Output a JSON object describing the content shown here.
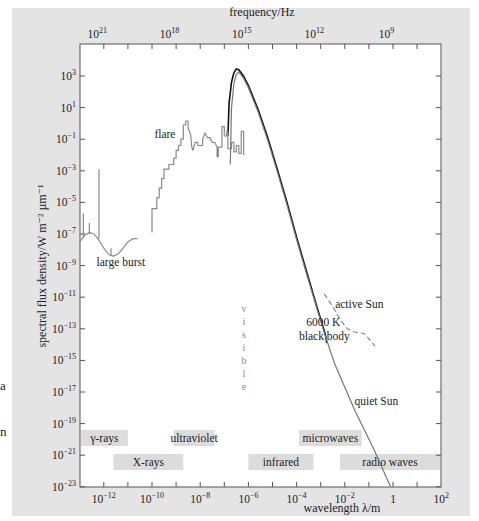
{
  "chart_data": {
    "type": "line",
    "title": "",
    "xlabel": "wavelength λ/m",
    "ylabel": "spectral flux density/W m⁻² µm⁻¹",
    "top_xlabel": "frequency/Hz",
    "x_scale": "log",
    "y_scale": "log",
    "xlim_log10": [
      -13,
      2
    ],
    "ylim_log10": [
      -23,
      4.9
    ],
    "x_ticks": [
      {
        "exp": "-12",
        "log": -12,
        "base": "10"
      },
      {
        "exp": "-10",
        "log": -10,
        "base": "10"
      },
      {
        "exp": "-8",
        "log": -8,
        "base": "10"
      },
      {
        "exp": "-6",
        "log": -6,
        "base": "10"
      },
      {
        "exp": "-4",
        "log": -4,
        "base": "10"
      },
      {
        "exp": "-2",
        "log": -2,
        "base": "10"
      },
      {
        "exp": "",
        "log": 0,
        "base": "1"
      },
      {
        "exp": "2",
        "log": 2,
        "base": "10"
      }
    ],
    "top_ticks": [
      {
        "exp": "21",
        "lambda_log": -12.52,
        "base": "10"
      },
      {
        "exp": "18",
        "lambda_log": -9.52,
        "base": "10"
      },
      {
        "exp": "15",
        "lambda_log": -6.52,
        "base": "10"
      },
      {
        "exp": "12",
        "lambda_log": -3.52,
        "base": "10"
      },
      {
        "exp": "9",
        "lambda_log": -0.52,
        "base": "10"
      }
    ],
    "y_ticks": [
      {
        "exp": "3",
        "log": 3
      },
      {
        "exp": "1",
        "log": 1
      },
      {
        "exp": "−1",
        "log": -1
      },
      {
        "exp": "−3",
        "log": -3
      },
      {
        "exp": "−5",
        "log": -5
      },
      {
        "exp": "−7",
        "log": -7
      },
      {
        "exp": "−9",
        "log": -9
      },
      {
        "exp": "−11",
        "log": -11
      },
      {
        "exp": "−13",
        "log": -13
      },
      {
        "exp": "−15",
        "log": -15
      },
      {
        "exp": "−17",
        "log": -17
      },
      {
        "exp": "−19",
        "log": -19
      },
      {
        "exp": "−21",
        "log": -21
      },
      {
        "exp": "−23",
        "log": -23
      }
    ],
    "series": [
      {
        "name": "6000 K black body",
        "style": "solid-black",
        "color": "#111111",
        "points_log": [
          [
            -6.85,
            -0.8
          ],
          [
            -6.8,
            1.3
          ],
          [
            -6.7,
            2.6
          ],
          [
            -6.6,
            3.2
          ],
          [
            -6.5,
            3.45
          ],
          [
            -6.4,
            3.4
          ],
          [
            -6.2,
            3.0
          ],
          [
            -6.0,
            2.4
          ],
          [
            -5.6,
            0.9
          ],
          [
            -5.2,
            -0.9
          ],
          [
            -4.8,
            -2.9
          ],
          [
            -4.4,
            -5.0
          ],
          [
            -4.0,
            -7.2
          ],
          [
            -3.6,
            -9.3
          ],
          [
            -3.2,
            -11.4
          ],
          [
            -2.8,
            -13.4
          ],
          [
            -2.75,
            -13.9
          ]
        ]
      },
      {
        "name": "quiet Sun",
        "style": "solid-gray",
        "color": "#777777",
        "points_log": [
          [
            -6.75,
            -2.6
          ],
          [
            -6.7,
            1.0
          ],
          [
            -6.6,
            2.5
          ],
          [
            -6.5,
            3.1
          ],
          [
            -6.4,
            3.25
          ],
          [
            -6.2,
            2.85
          ],
          [
            -6.0,
            2.25
          ],
          [
            -5.6,
            0.75
          ],
          [
            -5.2,
            -1.05
          ],
          [
            -4.8,
            -3.05
          ],
          [
            -4.4,
            -5.15
          ],
          [
            -4.0,
            -7.35
          ],
          [
            -3.6,
            -9.45
          ],
          [
            -3.2,
            -11.5
          ],
          [
            -2.8,
            -13.5
          ],
          [
            -2.4,
            -15.3
          ],
          [
            -1.6,
            -18.1
          ],
          [
            -0.8,
            -20.6
          ],
          [
            -0.1,
            -23.0
          ]
        ]
      },
      {
        "name": "active Sun",
        "style": "dashed-gray",
        "color": "#888888",
        "points_log": [
          [
            -2.85,
            -10.8
          ],
          [
            -2.5,
            -11.6
          ],
          [
            -2.2,
            -12.4
          ],
          [
            -1.9,
            -13.0
          ],
          [
            -1.6,
            -13.2
          ],
          [
            -1.2,
            -13.3
          ],
          [
            -0.9,
            -13.8
          ],
          [
            -0.75,
            -14.1
          ]
        ]
      },
      {
        "name": "flare",
        "style": "step-gray",
        "color": "#888888",
        "points_log": [
          [
            -10.0,
            -6.9
          ],
          [
            -10.0,
            -5.4
          ],
          [
            -9.8,
            -5.4
          ],
          [
            -9.8,
            -4.7
          ],
          [
            -9.7,
            -4.7
          ],
          [
            -9.7,
            -4.1
          ],
          [
            -9.6,
            -4.1
          ],
          [
            -9.6,
            -3.5
          ],
          [
            -9.5,
            -3.5
          ],
          [
            -9.5,
            -2.9
          ],
          [
            -9.3,
            -2.9
          ],
          [
            -9.3,
            -2.6
          ],
          [
            -9.1,
            -2.6
          ],
          [
            -9.1,
            -2.2
          ],
          [
            -9.0,
            -2.2
          ],
          [
            -9.0,
            -1.7
          ],
          [
            -8.9,
            -1.7
          ],
          [
            -8.9,
            -1.4
          ],
          [
            -8.8,
            -1.4
          ],
          [
            -8.8,
            -1.0
          ],
          [
            -8.7,
            -1.0
          ],
          [
            -8.7,
            -0.1
          ],
          [
            -8.6,
            -0.1
          ],
          [
            -8.6,
            0.15
          ],
          [
            -8.5,
            0.15
          ],
          [
            -8.5,
            -0.3
          ],
          [
            -8.4,
            -0.7
          ],
          [
            -8.35,
            -1.5
          ],
          [
            -8.3,
            -1.7
          ],
          [
            -8.25,
            -1.4
          ],
          [
            -8.2,
            -1.2
          ],
          [
            -8.1,
            -1.2
          ],
          [
            -8.1,
            -1.4
          ],
          [
            -7.9,
            -1.4
          ],
          [
            -7.9,
            -1.0
          ],
          [
            -7.8,
            -0.6
          ],
          [
            -7.7,
            -0.9
          ],
          [
            -7.6,
            -0.9
          ],
          [
            -7.5,
            -1.2
          ],
          [
            -7.4,
            -1.2
          ],
          [
            -7.3,
            -1.5
          ],
          [
            -7.3,
            -2.1
          ],
          [
            -7.25,
            -2.1
          ],
          [
            -7.25,
            -1.5
          ],
          [
            -7.1,
            -1.5
          ],
          [
            -7.1,
            -0.2
          ],
          [
            -7.0,
            -0.2
          ],
          [
            -7.0,
            -0.8
          ],
          [
            -6.9,
            -0.8
          ],
          [
            -6.9,
            -0.5
          ],
          [
            -6.85,
            -0.5
          ],
          [
            -6.85,
            -1.6
          ],
          [
            -6.7,
            -1.6
          ],
          [
            -6.7,
            -1.2
          ],
          [
            -6.6,
            -1.2
          ],
          [
            -6.6,
            -1.8
          ],
          [
            -6.5,
            -1.8
          ],
          [
            -6.5,
            -1.4
          ],
          [
            -6.4,
            -1.4
          ],
          [
            -6.4,
            -1.9
          ],
          [
            -6.3,
            -1.9
          ],
          [
            -6.3,
            -0.5
          ],
          [
            -6.2,
            -0.5
          ],
          [
            -6.2,
            -2.0
          ]
        ]
      },
      {
        "name": "large burst",
        "style": "solid-gray",
        "color": "#888888",
        "points_log": [
          [
            -13.0,
            -7.5
          ],
          [
            -12.8,
            -7.1
          ],
          [
            -12.6,
            -6.9
          ],
          [
            -12.4,
            -7.0
          ],
          [
            -12.2,
            -7.4
          ],
          [
            -12.0,
            -7.9
          ],
          [
            -11.8,
            -8.3
          ],
          [
            -11.6,
            -8.4
          ],
          [
            -11.4,
            -8.25
          ],
          [
            -11.2,
            -7.9
          ],
          [
            -11.0,
            -7.5
          ],
          [
            -10.8,
            -7.3
          ],
          [
            -10.6,
            -7.3
          ]
        ],
        "spikes_log": [
          [
            -12.85,
            -7.2,
            -5.7
          ],
          [
            -12.6,
            -7.0,
            -6.3
          ],
          [
            -12.2,
            -7.3,
            -2.9
          ],
          [
            -11.7,
            -8.4,
            -7.9
          ]
        ]
      }
    ],
    "annotations": [
      {
        "text": "flare",
        "log_x": -9.9,
        "log_y": -0.95
      },
      {
        "text": "large burst",
        "log_x": -12.3,
        "log_y": -9.0
      },
      {
        "text": "active Sun",
        "log_x": -2.4,
        "log_y": -11.7
      },
      {
        "text": "6000 K",
        "log_x": -3.6,
        "log_y": -12.8
      },
      {
        "text": "black body",
        "log_x": -3.9,
        "log_y": -13.7
      },
      {
        "text": "quiet Sun",
        "log_x": -1.6,
        "log_y": -17.8
      }
    ],
    "visible_label": "visible",
    "bands": [
      {
        "label": "γ-rays",
        "from": -13,
        "to": -11.0,
        "row": 1
      },
      {
        "label": "ultraviolet",
        "from": -9.1,
        "to": -7.4,
        "row": 1
      },
      {
        "label": "microwaves",
        "from": -3.9,
        "to": -1.3,
        "row": 1
      },
      {
        "label": "X-rays",
        "from": -11.6,
        "to": -8.7,
        "row": 2
      },
      {
        "label": "infrared",
        "from": -6.0,
        "to": -3.3,
        "row": 2
      },
      {
        "label": "radio waves",
        "from": -2.2,
        "to": 2.0,
        "row": 2
      }
    ]
  },
  "edge_fragments": [
    "a",
    "n"
  ]
}
